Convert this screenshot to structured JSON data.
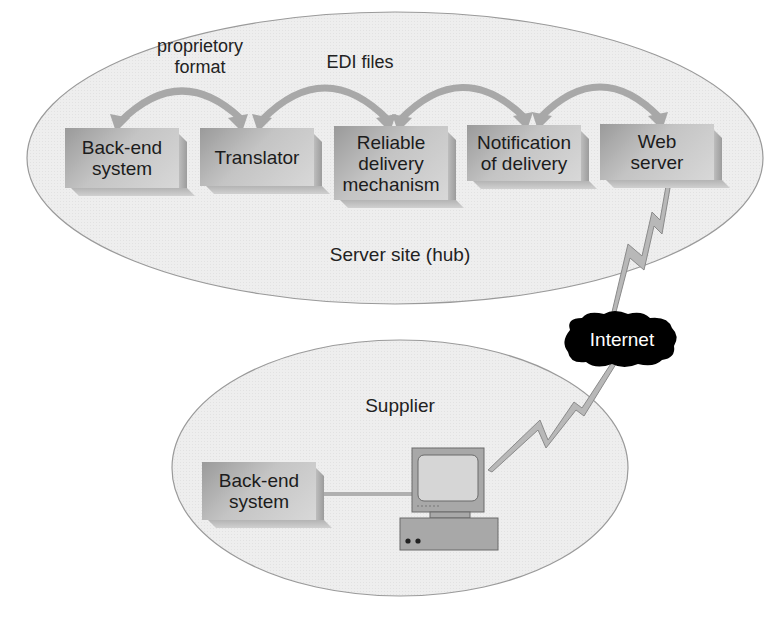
{
  "server_site": {
    "label": "Server site (hub)",
    "boxes": [
      {
        "id": "backend",
        "label_line1": "Back-end",
        "label_line2": "system"
      },
      {
        "id": "translator",
        "label_line1": "Translator",
        "label_line2": ""
      },
      {
        "id": "reliable",
        "label_line1": "Reliable",
        "label_line2": "delivery",
        "label_line3": "mechanism"
      },
      {
        "id": "notification",
        "label_line1": "Notification",
        "label_line2": "of delivery"
      },
      {
        "id": "webserver",
        "label_line1": "Web",
        "label_line2": "server"
      }
    ],
    "arrow_labels": {
      "proprietary_line1": "proprietory",
      "proprietary_line2": "format",
      "edi": "EDI files"
    }
  },
  "internet": {
    "label": "Internet"
  },
  "supplier": {
    "label": "Supplier",
    "backend_line1": "Back-end",
    "backend_line2": "system"
  },
  "colors": {
    "ellipse_fill": "#efefef",
    "ellipse_stroke": "#9a9a9a",
    "arrow": "#a8a8a8",
    "box_face": "#c4c4c4",
    "cloud": "#000000"
  }
}
